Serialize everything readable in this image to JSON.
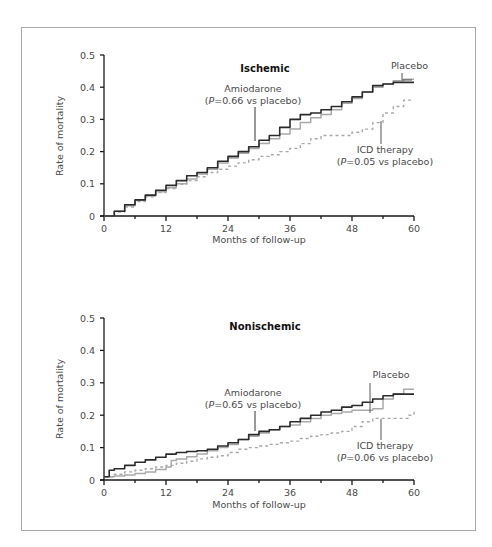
{
  "figure": {
    "panels": [
      {
        "title": "Ischemic",
        "xlabel": "Months of follow-up",
        "ylabel": "Rate of mortality",
        "annotations": {
          "placebo": "Placebo",
          "amiodarone_line1": "Amiodarone",
          "amiodarone_p": "P",
          "amiodarone_line2_rest": "=0.66 vs placebo)",
          "icd_line1": "ICD therapy",
          "icd_p": "P",
          "icd_line2_rest": "=0.05 vs placebo)"
        }
      },
      {
        "title": "Nonischemic",
        "xlabel": "Months of follow-up",
        "ylabel": "Rate of mortality",
        "annotations": {
          "placebo": "Placebo",
          "amiodarone_line1": "Amiodarone",
          "amiodarone_p": "P",
          "amiodarone_line2_rest": "=0.65 vs placebo)",
          "icd_line1": "ICD therapy",
          "icd_p": "P",
          "icd_line2_rest": "=0.06 vs placebo)"
        }
      }
    ]
  },
  "chart_data": [
    {
      "type": "line",
      "title": "Ischemic",
      "xlabel": "Months of follow-up",
      "ylabel": "Rate of mortality",
      "xlim": [
        0,
        60
      ],
      "ylim": [
        0,
        0.5
      ],
      "xticks": [
        0,
        12,
        24,
        36,
        48,
        60
      ],
      "yticks": [
        0,
        0.1,
        0.2,
        0.3,
        0.4,
        0.5
      ],
      "ytick_labels": [
        "0",
        "0.1",
        "0.2",
        "0.3",
        "0.4",
        "0.5"
      ],
      "grid": false,
      "legend": "inline annotations",
      "colors": {
        "amiodarone": "#2b2b2b",
        "placebo": "#a9a9a9",
        "icd": "#a9a9a9"
      },
      "series": [
        {
          "name": "Amiodarone",
          "style": "solid-dark",
          "annotation": "Amiodarone (P=0.66 vs placebo)",
          "x": [
            0,
            2,
            4,
            6,
            8,
            10,
            12,
            14,
            16,
            18,
            20,
            22,
            24,
            26,
            28,
            30,
            32,
            34,
            36,
            38,
            40,
            42,
            44,
            46,
            48,
            50,
            52,
            54,
            56,
            58,
            60
          ],
          "y": [
            0,
            0.015,
            0.035,
            0.05,
            0.065,
            0.08,
            0.095,
            0.11,
            0.125,
            0.135,
            0.15,
            0.17,
            0.185,
            0.2,
            0.215,
            0.235,
            0.25,
            0.275,
            0.3,
            0.315,
            0.32,
            0.33,
            0.34,
            0.355,
            0.37,
            0.385,
            0.405,
            0.41,
            0.415,
            0.415,
            0.415
          ]
        },
        {
          "name": "Placebo",
          "style": "solid-light",
          "annotation": "Placebo",
          "x": [
            0,
            2,
            4,
            6,
            8,
            10,
            12,
            14,
            16,
            18,
            20,
            22,
            24,
            26,
            28,
            30,
            32,
            34,
            36,
            38,
            40,
            42,
            44,
            46,
            48,
            50,
            52,
            54,
            56,
            58,
            60
          ],
          "y": [
            0,
            0.015,
            0.032,
            0.048,
            0.062,
            0.075,
            0.088,
            0.1,
            0.115,
            0.13,
            0.145,
            0.165,
            0.18,
            0.195,
            0.21,
            0.225,
            0.24,
            0.255,
            0.27,
            0.29,
            0.305,
            0.315,
            0.33,
            0.35,
            0.365,
            0.385,
            0.4,
            0.41,
            0.42,
            0.425,
            0.425
          ]
        },
        {
          "name": "ICD therapy",
          "style": "dashed-light",
          "annotation": "ICD therapy (P=0.05 vs placebo)",
          "x": [
            0,
            2,
            4,
            6,
            8,
            10,
            12,
            14,
            16,
            18,
            20,
            22,
            24,
            26,
            28,
            30,
            32,
            34,
            36,
            38,
            40,
            42,
            44,
            46,
            48,
            50,
            52,
            54,
            56,
            58,
            60
          ],
          "y": [
            0,
            0.012,
            0.028,
            0.045,
            0.06,
            0.073,
            0.085,
            0.098,
            0.11,
            0.122,
            0.135,
            0.145,
            0.155,
            0.165,
            0.175,
            0.185,
            0.19,
            0.2,
            0.21,
            0.225,
            0.24,
            0.25,
            0.25,
            0.25,
            0.26,
            0.27,
            0.29,
            0.32,
            0.34,
            0.36,
            0.36
          ]
        }
      ]
    },
    {
      "type": "line",
      "title": "Nonischemic",
      "xlabel": "Months of follow-up",
      "ylabel": "Rate of mortality",
      "xlim": [
        0,
        60
      ],
      "ylim": [
        0,
        0.5
      ],
      "xticks": [
        0,
        12,
        24,
        36,
        48,
        60
      ],
      "yticks": [
        0,
        0.1,
        0.2,
        0.3,
        0.4,
        0.5
      ],
      "ytick_labels": [
        "0",
        "0.1",
        "0.2",
        "0.3",
        "0.4",
        "0.5"
      ],
      "grid": false,
      "legend": "inline annotations",
      "colors": {
        "amiodarone": "#2b2b2b",
        "placebo": "#a9a9a9",
        "icd": "#a9a9a9"
      },
      "series": [
        {
          "name": "Amiodarone",
          "style": "solid-dark",
          "annotation": "Amiodarone (P=0.65 vs placebo)",
          "x": [
            0,
            1,
            2,
            4,
            6,
            8,
            10,
            12,
            14,
            16,
            18,
            20,
            22,
            24,
            26,
            28,
            30,
            32,
            34,
            36,
            38,
            40,
            42,
            44,
            46,
            48,
            50,
            52,
            54,
            56,
            58,
            60
          ],
          "y": [
            0.01,
            0.03,
            0.035,
            0.045,
            0.055,
            0.062,
            0.07,
            0.08,
            0.085,
            0.088,
            0.09,
            0.095,
            0.105,
            0.115,
            0.125,
            0.14,
            0.15,
            0.155,
            0.165,
            0.18,
            0.19,
            0.2,
            0.21,
            0.215,
            0.225,
            0.23,
            0.24,
            0.25,
            0.26,
            0.265,
            0.265,
            0.265
          ]
        },
        {
          "name": "Placebo",
          "style": "solid-light",
          "annotation": "Placebo",
          "x": [
            0,
            2,
            4,
            6,
            8,
            10,
            12,
            13,
            14,
            16,
            18,
            20,
            22,
            24,
            26,
            28,
            30,
            32,
            34,
            36,
            38,
            40,
            42,
            44,
            46,
            48,
            50,
            52,
            54,
            56,
            58,
            60
          ],
          "y": [
            0.01,
            0.012,
            0.015,
            0.02,
            0.025,
            0.032,
            0.04,
            0.06,
            0.065,
            0.072,
            0.08,
            0.09,
            0.1,
            0.11,
            0.125,
            0.135,
            0.145,
            0.155,
            0.165,
            0.17,
            0.18,
            0.19,
            0.2,
            0.205,
            0.21,
            0.215,
            0.215,
            0.22,
            0.25,
            0.265,
            0.28,
            0.28
          ]
        },
        {
          "name": "ICD therapy",
          "style": "dashed-light",
          "annotation": "ICD therapy (P=0.06 vs placebo)",
          "x": [
            0,
            2,
            4,
            6,
            8,
            10,
            12,
            14,
            16,
            18,
            20,
            22,
            24,
            26,
            28,
            30,
            32,
            34,
            36,
            38,
            40,
            42,
            44,
            46,
            48,
            50,
            52,
            54,
            56,
            58,
            59,
            60
          ],
          "y": [
            0.01,
            0.018,
            0.025,
            0.03,
            0.035,
            0.04,
            0.045,
            0.052,
            0.058,
            0.065,
            0.07,
            0.075,
            0.085,
            0.095,
            0.1,
            0.105,
            0.11,
            0.115,
            0.12,
            0.128,
            0.135,
            0.14,
            0.145,
            0.15,
            0.165,
            0.18,
            0.19,
            0.19,
            0.19,
            0.19,
            0.2,
            0.22
          ]
        }
      ]
    }
  ]
}
